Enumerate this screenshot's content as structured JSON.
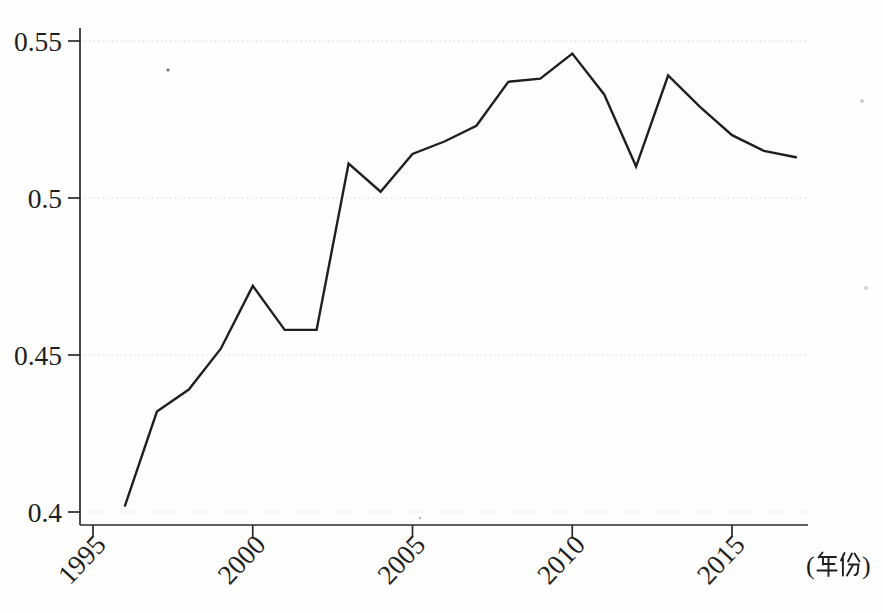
{
  "figure": {
    "background": "#ffffff"
  },
  "chart_data": {
    "type": "line",
    "title": "",
    "xlabel": "(年份)",
    "ylabel": "",
    "x": [
      1996,
      1997,
      1998,
      1999,
      2000,
      2001,
      2002,
      2003,
      2004,
      2005,
      2006,
      2007,
      2008,
      2009,
      2010,
      2011,
      2012,
      2013,
      2014,
      2015,
      2016,
      2017
    ],
    "values": [
      0.402,
      0.432,
      0.439,
      0.452,
      0.472,
      0.458,
      0.458,
      0.511,
      0.502,
      0.514,
      0.518,
      0.523,
      0.537,
      0.538,
      0.546,
      0.533,
      0.51,
      0.539,
      0.529,
      0.52,
      0.515,
      0.513
    ],
    "xticks": [
      1995,
      2000,
      2005,
      2010,
      2015
    ],
    "xtick_labels": [
      "1995",
      "2000",
      "2005",
      "2010",
      "2015"
    ],
    "yticks": [
      0.4,
      0.45,
      0.5,
      0.55
    ],
    "ytick_labels": [
      "0.4",
      "0.45",
      "0.5",
      "0.55"
    ],
    "ylim": [
      0.4,
      0.55
    ],
    "xlim": [
      1994.6,
      2017.4
    ],
    "grid": "horizontal dotted",
    "legend": "none",
    "series_count": 1,
    "line_color": "#1f1f1f",
    "axis_color": "#2a2a2a",
    "grid_color": "#e4e4e0",
    "text_color": "#1e1e1e",
    "xtick_label_rotation_deg": -47
  }
}
